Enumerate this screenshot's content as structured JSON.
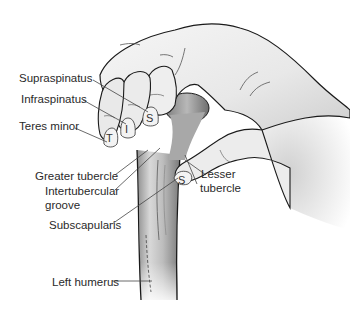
{
  "figure": {
    "labels": {
      "supraspinatus": "Supraspinatus",
      "infraspinatus": "Infraspinatus",
      "teres_minor": "Teres minor",
      "greater_tubercle": "Greater tubercle",
      "intertubercular_line1": "Intertubercular",
      "intertubercular_line2": "groove",
      "subscapularis": "Subscapularis",
      "left_humerus": "Left humerus",
      "lesser_line1": "Lesser",
      "lesser_line2": "tubercle"
    },
    "fingertip_letters": {
      "teres_minor": "T",
      "infraspinatus": "I",
      "supraspinatus": "S",
      "subscapularis_thumb": "S"
    },
    "colors": {
      "outline": "#1a1a1a",
      "skin": "#ececec",
      "skin_shadow": "#c9c9c9",
      "bone": "#d6d6d6",
      "bone_shadow": "#9a9a9a",
      "leader_line": "#444444",
      "text": "#2a2a2a"
    }
  }
}
